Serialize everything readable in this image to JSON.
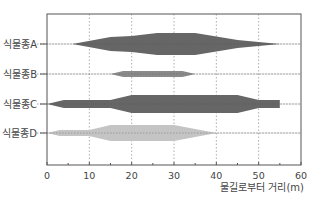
{
  "chart_data": {
    "type": "area",
    "subtype": "kite-diagram",
    "title": "",
    "xlabel": "물길로부터 거리(m)",
    "ylabel": "",
    "xlim": [
      0,
      60
    ],
    "xticks": [
      0,
      10,
      20,
      30,
      40,
      50,
      60
    ],
    "minor_xticks": [
      5,
      15,
      25,
      35,
      45,
      55
    ],
    "grid": {
      "vertical": true,
      "horizontal_center_lines": true,
      "style": "dotted"
    },
    "legend": null,
    "categories": [
      "식물종A",
      "식물종B",
      "식물종C",
      "식물종D"
    ],
    "series": [
      {
        "name": "식물종A",
        "color": "#666666",
        "profile": [
          [
            6,
            0
          ],
          [
            15,
            7
          ],
          [
            20,
            8
          ],
          [
            26,
            11
          ],
          [
            35,
            11
          ],
          [
            45,
            4
          ],
          [
            55,
            0
          ]
        ]
      },
      {
        "name": "식물종B",
        "color": "#8a8a8a",
        "profile": [
          [
            15,
            0
          ],
          [
            18,
            3
          ],
          [
            32,
            3
          ],
          [
            35,
            0
          ]
        ]
      },
      {
        "name": "식물종C",
        "color": "#666666",
        "profile": [
          [
            0,
            0
          ],
          [
            4,
            4
          ],
          [
            15,
            4
          ],
          [
            20,
            9
          ],
          [
            45,
            9
          ],
          [
            50,
            4
          ],
          [
            55,
            4
          ]
        ],
        "square_end": true
      },
      {
        "name": "식물종D",
        "color": "#c4c4c4",
        "profile": [
          [
            0,
            0
          ],
          [
            3,
            3
          ],
          [
            10,
            3
          ],
          [
            15,
            8
          ],
          [
            30,
            8
          ],
          [
            40,
            0
          ]
        ]
      }
    ],
    "note": "profile values are [distance_m, half-width_px] of kite shape; relative abundance"
  }
}
